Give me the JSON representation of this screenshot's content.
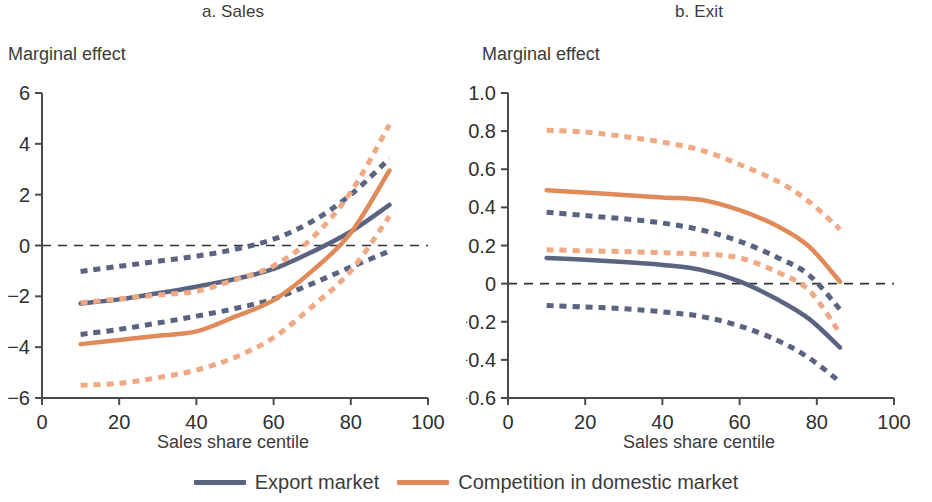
{
  "figure": {
    "y_axis_title": "Marginal effect",
    "x_axis_title": "Sales share centile"
  },
  "legend": {
    "position": "bottom-center",
    "items": [
      {
        "label": "Export market",
        "color": "#5a6480",
        "style": "solid"
      },
      {
        "label": "Competition in domestic market",
        "color": "#e08a5a",
        "style": "solid"
      }
    ]
  },
  "colors": {
    "export_market": "#5a6480",
    "export_market_ci": "#5a6480",
    "domestic_competition": "#e08a5a",
    "domestic_competition_ci": "#efa985",
    "axis": "#4a4a4a",
    "zero_line": "#333333",
    "text": "#3b3b3b",
    "background": "#ffffff"
  },
  "chart_data": [
    {
      "type": "line",
      "id": "panel-a",
      "title": "a. Sales",
      "xlabel": "Sales share centile",
      "ylabel": "Marginal effect",
      "xlim": [
        0,
        100
      ],
      "ylim": [
        -6,
        6
      ],
      "xticks": [
        0,
        20,
        40,
        60,
        80,
        100
      ],
      "yticks": [
        -6,
        -4,
        -2,
        0,
        2,
        4,
        6
      ],
      "grid": false,
      "zero_reference_line": 0,
      "x": [
        10,
        20,
        30,
        40,
        50,
        60,
        70,
        80,
        90
      ],
      "series": [
        {
          "name": "Export market",
          "color": "#5a6480",
          "style": "solid",
          "values": [
            -2.28,
            -2.12,
            -1.88,
            -1.62,
            -1.32,
            -0.92,
            -0.25,
            0.55,
            1.6
          ]
        },
        {
          "name": "Export market upper CI",
          "color": "#5a6480",
          "style": "dashed",
          "values": [
            -1.02,
            -0.82,
            -0.62,
            -0.42,
            -0.15,
            0.25,
            0.95,
            2.0,
            3.42
          ]
        },
        {
          "name": "Export market lower CI",
          "color": "#5a6480",
          "style": "dashed",
          "values": [
            -3.5,
            -3.3,
            -3.05,
            -2.78,
            -2.48,
            -2.1,
            -1.5,
            -0.85,
            -0.22
          ]
        },
        {
          "name": "Competition in domestic market",
          "color": "#e08a5a",
          "style": "solid",
          "values": [
            -3.88,
            -3.72,
            -3.55,
            -3.38,
            -2.8,
            -2.15,
            -1.0,
            0.5,
            2.95
          ]
        },
        {
          "name": "Competition in domestic market upper CI",
          "color": "#efa985",
          "style": "dashed",
          "values": [
            -2.25,
            -2.1,
            -1.95,
            -1.8,
            -1.35,
            -0.8,
            0.3,
            2.1,
            4.75
          ]
        },
        {
          "name": "Competition in domestic market lower CI",
          "color": "#efa985",
          "style": "dashed",
          "values": [
            -5.5,
            -5.42,
            -5.2,
            -4.9,
            -4.4,
            -3.62,
            -2.4,
            -1.0,
            1.15
          ]
        }
      ]
    },
    {
      "type": "line",
      "id": "panel-b",
      "title": "b. Exit",
      "xlabel": "Sales share centile",
      "ylabel": "Marginal effect",
      "xlim": [
        0,
        100
      ],
      "ylim": [
        -0.6,
        1.0
      ],
      "xticks": [
        0,
        20,
        40,
        60,
        80,
        100
      ],
      "yticks": [
        -0.6,
        -0.4,
        -0.2,
        0,
        0.2,
        0.4,
        0.6,
        0.8,
        1.0
      ],
      "ytick_labels": [
        "-0.6",
        "-0.4",
        "-0.2",
        "0",
        "0.2",
        "0.4",
        "0.6",
        "0.8",
        "1.0"
      ],
      "grid": false,
      "zero_reference_line": 0,
      "x": [
        10,
        20,
        30,
        40,
        50,
        60,
        70,
        78,
        86
      ],
      "series": [
        {
          "name": "Export market",
          "color": "#5a6480",
          "style": "solid",
          "values": [
            0.135,
            0.125,
            0.113,
            0.098,
            0.072,
            0.012,
            -0.085,
            -0.185,
            -0.335
          ]
        },
        {
          "name": "Export market upper CI",
          "color": "#5a6480",
          "style": "dashed",
          "values": [
            0.375,
            0.357,
            0.34,
            0.318,
            0.282,
            0.222,
            0.135,
            0.045,
            -0.135
          ]
        },
        {
          "name": "Export market lower CI",
          "color": "#5a6480",
          "style": "dashed",
          "values": [
            -0.115,
            -0.122,
            -0.132,
            -0.148,
            -0.172,
            -0.222,
            -0.3,
            -0.39,
            -0.515
          ]
        },
        {
          "name": "Competition in domestic market",
          "color": "#e08a5a",
          "style": "solid",
          "values": [
            0.49,
            0.478,
            0.465,
            0.452,
            0.44,
            0.385,
            0.3,
            0.195,
            0.01
          ]
        },
        {
          "name": "Competition in domestic market upper CI",
          "color": "#efa985",
          "style": "dashed",
          "values": [
            0.805,
            0.795,
            0.772,
            0.742,
            0.7,
            0.625,
            0.535,
            0.43,
            0.285
          ]
        },
        {
          "name": "Competition in domestic market lower CI",
          "color": "#efa985",
          "style": "dashed",
          "values": [
            0.178,
            0.172,
            0.168,
            0.162,
            0.155,
            0.135,
            0.058,
            -0.035,
            -0.26
          ]
        }
      ]
    }
  ]
}
